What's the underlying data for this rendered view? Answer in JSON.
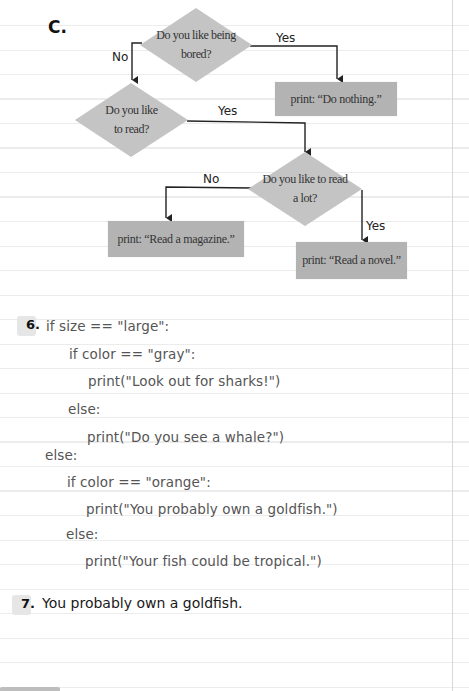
{
  "section_c": {
    "letter": "C.",
    "flowchart": {
      "decisions": [
        {
          "id": "d1",
          "text_line1": "Do you like being",
          "text_line2": "bored?"
        },
        {
          "id": "d2",
          "text_line1": "Do you like",
          "text_line2": "to read?"
        },
        {
          "id": "d3",
          "text_line1": "Do you like to read",
          "text_line2": "a lot?"
        }
      ],
      "outputs": [
        {
          "id": "o1",
          "text": "print: “Do nothing.”"
        },
        {
          "id": "o2",
          "text": "print: “Read a magazine.”"
        },
        {
          "id": "o3",
          "text": "print: “Read a novel.”"
        }
      ],
      "edge_labels": {
        "d1_no": "No",
        "d1_yes": "Yes",
        "d2_yes": "Yes",
        "d3_no": "No",
        "d3_yes": "Yes"
      },
      "colors": {
        "shape_fill": "#c4c4c4",
        "box_fill": "#b3b3b3",
        "line": "#222222"
      }
    }
  },
  "question_6": {
    "number": "6.",
    "code_lines": [
      "if size == \"large\":",
      "if color == \"gray\":",
      "print(\"Look out for sharks!\")",
      "else:",
      "print(\"Do you see a whale?\")",
      "else:",
      "if color == \"orange\":",
      "print(\"You probably own a goldfish.\")",
      "else:",
      "print(\"Your fish could be tropical.\")"
    ]
  },
  "question_7": {
    "number": "7.",
    "answer": "You probably own a goldfish."
  }
}
